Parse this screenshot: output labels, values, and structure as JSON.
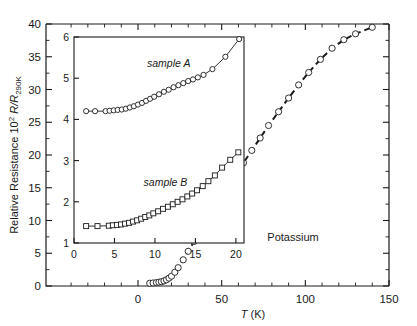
{
  "chart_data": [
    {
      "id": "main",
      "type": "scatter",
      "title": "",
      "xlabel": "T (K)",
      "ylabel": "Relative Resistance 10",
      "ylabel_sup": "2",
      "ylabel_italic": "R/R",
      "ylabel_sub": "290K",
      "annotation": "Potassium",
      "xlim": [
        -55,
        150
      ],
      "ylim": [
        0,
        40
      ],
      "xticks": [
        0,
        50,
        100,
        150
      ],
      "xtick_labels": [
        "0",
        "50",
        "100",
        "150"
      ],
      "yticks": [
        0,
        5,
        10,
        15,
        20,
        25,
        30,
        35,
        40
      ],
      "ytick_labels": [
        "0",
        "5",
        "10",
        "15",
        "20",
        "25",
        "30",
        "35",
        "40"
      ],
      "x_minor_step": 10,
      "y_minor_step": 2.5,
      "grid": false,
      "legend": "none",
      "marker": "circle-open",
      "fit_line": "dashed",
      "x": [
        7,
        9,
        11,
        12.5,
        14,
        15.5,
        17,
        18.5,
        20,
        22,
        24,
        27,
        30,
        33.5,
        37,
        41,
        45,
        49,
        53.5,
        58,
        63,
        68,
        73,
        78,
        84,
        90,
        96,
        102,
        109,
        116,
        123,
        130,
        140
      ],
      "values": [
        0.42,
        0.46,
        0.52,
        0.58,
        0.66,
        0.78,
        0.95,
        1.2,
        1.5,
        2.1,
        2.8,
        4.0,
        5.3,
        6.8,
        8.3,
        10.0,
        11.6,
        13.2,
        15.0,
        16.8,
        18.8,
        20.7,
        22.6,
        24.5,
        26.6,
        28.7,
        30.7,
        32.6,
        34.6,
        36.3,
        37.6,
        38.5,
        39.5
      ]
    },
    {
      "id": "inset",
      "type": "scatter",
      "title": "",
      "xlabel": "",
      "ylabel": "",
      "xlim": [
        0,
        21
      ],
      "ylim": [
        1,
        6
      ],
      "xticks": [
        0,
        5,
        10,
        15,
        20
      ],
      "xtick_labels": [
        "0",
        "5",
        "10",
        "15",
        "20"
      ],
      "yticks": [
        1,
        2,
        3,
        4,
        5,
        6
      ],
      "ytick_labels": [
        "1",
        "2",
        "3",
        "4",
        "5",
        "6"
      ],
      "grid": false,
      "legend": "inline-labels",
      "series": [
        {
          "name": "sample A",
          "marker": "circle-open",
          "label_x": 11.7,
          "label_y": 5.28,
          "x": [
            1.5,
            2.6,
            3.9,
            4.4,
            4.9,
            5.4,
            5.9,
            6.4,
            6.9,
            7.4,
            7.9,
            8.4,
            8.9,
            9.4,
            9.9,
            10.5,
            11.1,
            11.7,
            12.3,
            12.9,
            13.5,
            14.1,
            14.7,
            15.3,
            16.0,
            17.1,
            18.7,
            20.4
          ],
          "values": [
            4.2,
            4.2,
            4.2,
            4.21,
            4.22,
            4.23,
            4.24,
            4.26,
            4.29,
            4.32,
            4.36,
            4.4,
            4.45,
            4.5,
            4.55,
            4.61,
            4.67,
            4.72,
            4.78,
            4.83,
            4.88,
            4.93,
            4.97,
            5.02,
            5.08,
            5.22,
            5.52,
            5.95
          ]
        },
        {
          "name": "sample B",
          "marker": "square-open",
          "label_x": 11.3,
          "label_y": 2.38,
          "x": [
            1.5,
            2.9,
            4.3,
            4.8,
            5.3,
            5.8,
            6.3,
            6.8,
            7.3,
            7.8,
            8.3,
            8.8,
            9.3,
            9.8,
            10.4,
            11.0,
            11.6,
            12.2,
            12.8,
            13.4,
            14.0,
            14.6,
            15.2,
            15.9,
            16.6,
            17.4,
            18.3,
            19.3,
            20.3
          ],
          "values": [
            1.41,
            1.41,
            1.42,
            1.43,
            1.44,
            1.45,
            1.47,
            1.49,
            1.52,
            1.55,
            1.59,
            1.63,
            1.67,
            1.72,
            1.77,
            1.83,
            1.88,
            1.94,
            2.0,
            2.06,
            2.13,
            2.2,
            2.28,
            2.38,
            2.5,
            2.64,
            2.83,
            3.02,
            3.2
          ]
        }
      ]
    }
  ],
  "figure": {
    "ylabel_prefix": "Relative Resistance 10",
    "ylabel_exponent": "2",
    "ylabel_ratio": "R/R",
    "ylabel_subscript": "290K",
    "xlabel_symbol": "T",
    "xlabel_unit": "(K)",
    "annotation": "Potassium",
    "series_a_label": "sample A",
    "series_b_label": "sample B"
  }
}
